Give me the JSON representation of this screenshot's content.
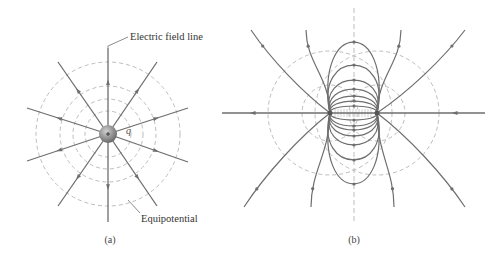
{
  "colors": {
    "field_line": "#6e6e6e",
    "equipotential": "#bdbdbd",
    "axis": "#bdbdbd",
    "charge_fill": "#8a8a8a",
    "text": "#333333"
  },
  "panel_a": {
    "caption": "(a)",
    "charge_label": "q",
    "field_line_label": "Electric field line",
    "equipotential_label": "Equipotential",
    "charge_center": [
      108,
      134
    ],
    "charge_radius": 9,
    "equipotential_radii": [
      23,
      35,
      48,
      72
    ],
    "radial_line_endpoints": [
      [
        108,
        48
      ],
      [
        108,
        222
      ],
      [
        58,
        62
      ],
      [
        157,
        62
      ],
      [
        27,
        108
      ],
      [
        188,
        108
      ],
      [
        27,
        161
      ],
      [
        188,
        162
      ],
      [
        58,
        206
      ],
      [
        157,
        206
      ]
    ]
  },
  "panel_b": {
    "caption": "(b)",
    "charges": [
      [
        330,
        113
      ],
      [
        377,
        113
      ]
    ],
    "axis_x": 354,
    "axis_y_range": [
      8,
      222
    ],
    "equipotential_circles": [
      {
        "cx": 330,
        "cy": 113,
        "r": 62
      },
      {
        "cx": 377,
        "cy": 113,
        "r": 62
      },
      {
        "cx": 330,
        "cy": 113,
        "r": 28
      },
      {
        "cx": 377,
        "cy": 113,
        "r": 28
      }
    ],
    "inner_loop_peaks_top": [
      42,
      65,
      80,
      89,
      96,
      101,
      106
    ],
    "inner_loop_peaks_bottom": [
      184,
      160,
      145,
      136,
      130,
      126,
      120
    ],
    "outer_lines_top": [
      [
        251,
        30
      ],
      [
        306,
        30
      ],
      [
        401,
        30
      ],
      [
        465,
        30
      ]
    ],
    "outer_lines_bottom": [
      [
        244,
        207
      ],
      [
        311,
        207
      ],
      [
        394,
        207
      ],
      [
        465,
        207
      ]
    ],
    "horizontal_left_end": 222,
    "horizontal_right_end": 485
  },
  "captions": {
    "a": "(a)",
    "b": "(b)"
  }
}
